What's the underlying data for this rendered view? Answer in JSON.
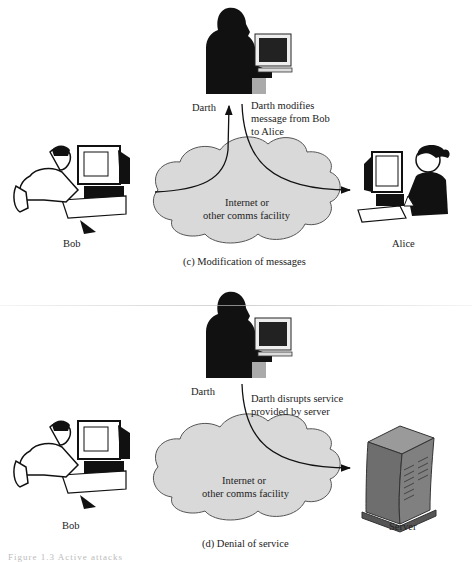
{
  "panel_c": {
    "attacker_label": "Darth",
    "action_text_lines": [
      "Darth modifies",
      "message from Bob",
      "to Alice"
    ],
    "sender_label": "Bob",
    "receiver_label": "Alice",
    "network_text_lines": [
      "Internet or",
      "other comms facility"
    ],
    "caption": "(c) Modification of messages"
  },
  "panel_d": {
    "attacker_label": "Darth",
    "action_text_lines": [
      "Darth disrupts service",
      "provided by server"
    ],
    "sender_label": "Bob",
    "receiver_label": "Server",
    "network_text_lines": [
      "Internet or",
      "other comms facility"
    ],
    "caption": "(d) Denial of service"
  },
  "figure_caption": "Figure 1.3  Active attacks",
  "colors": {
    "cloud_fill": "#d9d9d9",
    "cloud_stroke": "#555555",
    "silhouette": "#111111",
    "arrow": "#111111",
    "server_body": "#7a7a7a"
  }
}
